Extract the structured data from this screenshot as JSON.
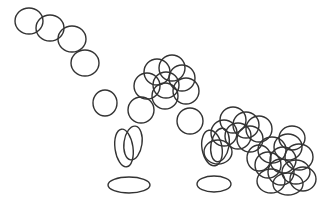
{
  "canvas": {
    "width": 323,
    "height": 204,
    "background_color": "#ffffff",
    "title": "Overlapping ellipse line sketch"
  },
  "style": {
    "stroke_color": "#333333",
    "stroke_width": 1.4,
    "fill": "none"
  },
  "chart_data": {
    "type": "scatter",
    "xlabel": "",
    "ylabel": "",
    "xlim": [
      0,
      323
    ],
    "ylim": [
      0,
      204
    ],
    "grid": false,
    "legend": "none",
    "marker": "open-ellipse",
    "groups": [
      {
        "name": "top-left-chain",
        "count": 3,
        "shapes": [
          {
            "cx": 29,
            "cy": 21,
            "rx": 14,
            "ry": 13,
            "rot": 0
          },
          {
            "cx": 50,
            "cy": 28,
            "rx": 14,
            "ry": 13,
            "rot": 0
          },
          {
            "cx": 72,
            "cy": 39,
            "rx": 14,
            "ry": 13,
            "rot": 0
          }
        ]
      },
      {
        "name": "isolated-upper-mid",
        "count": 1,
        "shapes": [
          {
            "cx": 85,
            "cy": 63,
            "rx": 14,
            "ry": 13,
            "rot": 0
          }
        ]
      },
      {
        "name": "isolated-mid-left",
        "count": 1,
        "shapes": [
          {
            "cx": 105,
            "cy": 103,
            "rx": 12,
            "ry": 13,
            "rot": 0
          }
        ]
      },
      {
        "name": "isolated-mid-right",
        "count": 1,
        "shapes": [
          {
            "cx": 141,
            "cy": 110,
            "rx": 13,
            "ry": 13,
            "rot": 0
          }
        ]
      },
      {
        "name": "isolated-right-mid",
        "count": 1,
        "shapes": [
          {
            "cx": 190,
            "cy": 121,
            "rx": 13,
            "ry": 13,
            "rot": 0
          }
        ]
      },
      {
        "name": "center-arch",
        "count": 7,
        "shapes": [
          {
            "cx": 147,
            "cy": 86,
            "rx": 13,
            "ry": 13,
            "rot": 0
          },
          {
            "cx": 157,
            "cy": 72,
            "rx": 13,
            "ry": 13,
            "rot": 0
          },
          {
            "cx": 166,
            "cy": 85,
            "rx": 13,
            "ry": 13,
            "rot": 0
          },
          {
            "cx": 172,
            "cy": 68,
            "rx": 13,
            "ry": 13,
            "rot": 0
          },
          {
            "cx": 182,
            "cy": 78,
            "rx": 13,
            "ry": 13,
            "rot": 0
          },
          {
            "cx": 186,
            "cy": 91,
            "rx": 13,
            "ry": 13,
            "rot": 0
          },
          {
            "cx": 165,
            "cy": 96,
            "rx": 13,
            "ry": 13,
            "rot": 0
          }
        ]
      },
      {
        "name": "center-tall-pair",
        "count": 2,
        "shapes": [
          {
            "cx": 124,
            "cy": 148,
            "rx": 9,
            "ry": 19,
            "rot": -8
          },
          {
            "cx": 133,
            "cy": 143,
            "rx": 9,
            "ry": 17,
            "rot": 8
          }
        ]
      },
      {
        "name": "center-flat-ellipse",
        "count": 1,
        "shapes": [
          {
            "cx": 129,
            "cy": 185,
            "rx": 21,
            "ry": 8,
            "rot": 0
          }
        ]
      },
      {
        "name": "right-tall-pair",
        "count": 3,
        "shapes": [
          {
            "cx": 212,
            "cy": 148,
            "rx": 10,
            "ry": 18,
            "rot": -10
          },
          {
            "cx": 220,
            "cy": 145,
            "rx": 9,
            "ry": 17,
            "rot": 10
          },
          {
            "cx": 218,
            "cy": 152,
            "rx": 14,
            "ry": 12,
            "rot": 0
          }
        ]
      },
      {
        "name": "right-flat-ellipse",
        "count": 1,
        "shapes": [
          {
            "cx": 214,
            "cy": 184,
            "rx": 17,
            "ry": 8,
            "rot": 0
          }
        ]
      },
      {
        "name": "right-arch",
        "count": 6,
        "shapes": [
          {
            "cx": 224,
            "cy": 133,
            "rx": 13,
            "ry": 13,
            "rot": 0
          },
          {
            "cx": 233,
            "cy": 120,
            "rx": 13,
            "ry": 13,
            "rot": 0
          },
          {
            "cx": 246,
            "cy": 125,
            "rx": 13,
            "ry": 13,
            "rot": 0
          },
          {
            "cx": 250,
            "cy": 139,
            "rx": 13,
            "ry": 13,
            "rot": 0
          },
          {
            "cx": 238,
            "cy": 136,
            "rx": 13,
            "ry": 13,
            "rot": 0
          },
          {
            "cx": 259,
            "cy": 129,
            "rx": 13,
            "ry": 13,
            "rot": 0
          }
        ]
      },
      {
        "name": "bottom-right-dense-cluster",
        "count": 12,
        "shapes": [
          {
            "cx": 272,
            "cy": 150,
            "rx": 14,
            "ry": 13,
            "rot": 0
          },
          {
            "cx": 288,
            "cy": 147,
            "rx": 14,
            "ry": 13,
            "rot": 0
          },
          {
            "cx": 299,
            "cy": 157,
            "rx": 14,
            "ry": 13,
            "rot": 0
          },
          {
            "cx": 283,
            "cy": 160,
            "rx": 13,
            "ry": 13,
            "rot": 0
          },
          {
            "cx": 268,
            "cy": 165,
            "rx": 13,
            "ry": 13,
            "rot": 0
          },
          {
            "cx": 281,
            "cy": 172,
            "rx": 13,
            "ry": 13,
            "rot": 0
          },
          {
            "cx": 296,
            "cy": 172,
            "rx": 14,
            "ry": 12,
            "rot": 0
          },
          {
            "cx": 271,
            "cy": 181,
            "rx": 14,
            "ry": 12,
            "rot": 0
          },
          {
            "cx": 288,
            "cy": 184,
            "rx": 15,
            "ry": 11,
            "rot": 0
          },
          {
            "cx": 303,
            "cy": 179,
            "rx": 13,
            "ry": 12,
            "rot": 0
          },
          {
            "cx": 292,
            "cy": 138,
            "rx": 13,
            "ry": 12,
            "rot": 0
          },
          {
            "cx": 259,
            "cy": 158,
            "rx": 12,
            "ry": 13,
            "rot": 0
          }
        ]
      }
    ]
  }
}
